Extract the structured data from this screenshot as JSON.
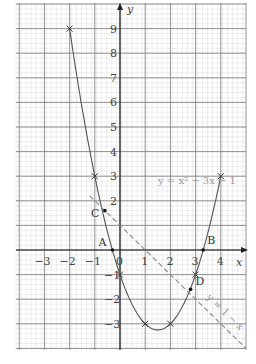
{
  "chart_data": {
    "type": "line",
    "title": "",
    "xlabel": "x",
    "ylabel": "y",
    "xlim": [
      -4,
      5
    ],
    "ylim": [
      -4,
      10
    ],
    "grid": true,
    "x_ticks": [
      "-3",
      "-2",
      "-1",
      "0",
      "1",
      "2",
      "3",
      "4"
    ],
    "y_ticks": [
      "9",
      "8",
      "7",
      "6",
      "5",
      "4",
      "3",
      "2",
      "-1",
      "-2",
      "-3"
    ],
    "series": [
      {
        "name": "y = x² − 3x − 1",
        "style": "solid",
        "plotted_points": [
          {
            "x": -2,
            "y": 9
          },
          {
            "x": -1,
            "y": 3
          },
          {
            "x": 0,
            "y": -1
          },
          {
            "x": 1,
            "y": -3
          },
          {
            "x": 2,
            "y": -3
          },
          {
            "x": 3,
            "y": -1
          },
          {
            "x": 4,
            "y": 3
          }
        ]
      },
      {
        "name": "y = 1 − x",
        "style": "dashed",
        "x_range": [
          -1.2,
          5
        ]
      }
    ],
    "annotations": [
      {
        "label": "A",
        "x": -0.3,
        "y": 0
      },
      {
        "label": "B",
        "x": 3.3,
        "y": 0
      },
      {
        "label": "C",
        "x": -0.6,
        "y": 1.6
      },
      {
        "label": "D",
        "x": 2.8,
        "y": -1.6
      }
    ],
    "equation_label": "y = x² − 3x − 1",
    "line_label": "y = 1 − x"
  }
}
